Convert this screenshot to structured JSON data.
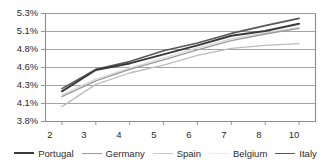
{
  "chart_data": {
    "type": "line",
    "title": "",
    "subtitle": "",
    "xlabel": "",
    "ylabel": "",
    "grid": true,
    "legend_position": "bottom",
    "x": [
      2,
      3,
      4,
      5,
      6,
      7,
      8,
      10
    ],
    "x_tick_labels": [
      "2",
      "3",
      "4",
      "5",
      "6",
      "7",
      "8",
      "10"
    ],
    "y_tick_labels": [
      "3.8%",
      "4.1%",
      "4.3%",
      "4.6%",
      "4.8%",
      "5.1%",
      "5.3%"
    ],
    "y_tick_values": [
      3.8,
      4.1,
      4.3,
      4.6,
      4.8,
      5.1,
      5.3
    ],
    "ylim": [
      3.8,
      5.33
    ],
    "series": [
      {
        "name": "Portugal",
        "color": "#3a3a3a",
        "width": 2.0,
        "values": [
          4.23,
          4.55,
          4.64,
          4.74,
          4.86,
          5.02,
          5.1,
          5.18
        ]
      },
      {
        "name": "Germany",
        "color": "#9a9a9a",
        "width": 1.3,
        "values": [
          4.17,
          4.37,
          4.56,
          4.68,
          4.79,
          4.94,
          5.05,
          5.13
        ]
      },
      {
        "name": "Spain",
        "color": "#bdbdbd",
        "width": 1.3,
        "values": [
          4.04,
          4.31,
          4.5,
          4.62,
          4.73,
          4.81,
          4.86,
          4.89
        ]
      },
      {
        "name": "Belgium",
        "color": "#d8d8d8",
        "width": 1.3,
        "values": [
          4.19,
          4.4,
          4.58,
          4.7,
          4.82,
          4.97,
          5.07,
          5.14
        ]
      },
      {
        "name": "Italy",
        "color": "#585858",
        "width": 1.6,
        "values": [
          4.26,
          4.56,
          4.66,
          4.78,
          4.9,
          5.06,
          5.16,
          5.24
        ]
      }
    ]
  },
  "axes": {
    "y_labels": [
      "5.3%",
      "5.1%",
      "4.8%",
      "4.6%",
      "4.3%",
      "4.1%",
      "3.8%"
    ],
    "x_labels": [
      "2",
      "3",
      "4",
      "5",
      "6",
      "7",
      "8",
      "10"
    ]
  },
  "legend": {
    "items": [
      {
        "label": "Portugal",
        "color": "#3a3a3a",
        "thickness": "2px"
      },
      {
        "label": "Germany",
        "color": "#9a9a9a",
        "thickness": "1.5px"
      },
      {
        "label": "Spain",
        "color": "#c8c8c8",
        "thickness": "1.5px"
      },
      {
        "label": "Belgium",
        "color": "#e8e8e8",
        "thickness": "1.5px"
      },
      {
        "label": "Italy",
        "color": "#585858",
        "thickness": "1.5px"
      }
    ]
  },
  "style": {
    "axis_color": "#8c8c8c",
    "grid_color": "#9a9a9a",
    "text_color": "#2b2b2b",
    "background": "#ffffff"
  }
}
